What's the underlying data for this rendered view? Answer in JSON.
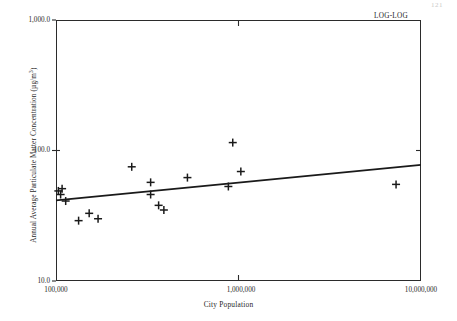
{
  "page": {
    "number": "121"
  },
  "annotation": {
    "loglog_label": "LOG-LOG"
  },
  "axes": {
    "x_title": "City Population",
    "y_title_main": "Annual Average Particulate Matter Concentration (µg/m",
    "y_title_exponent": "3",
    "y_title_close": ")",
    "x_ticks": [
      {
        "label": "100,000",
        "value": 100000
      },
      {
        "label": "1,000,000",
        "value": 1000000
      },
      {
        "label": "10,000,000",
        "value": 10000000
      }
    ],
    "y_ticks": [
      {
        "label": "10.0",
        "value": 10
      },
      {
        "label": "100.0",
        "value": 100
      },
      {
        "label": "1,000.0",
        "value": 1000
      }
    ]
  },
  "chart_data": {
    "type": "scatter",
    "title": "",
    "subtitle": "",
    "annotation": "LOG-LOG",
    "xlabel": "City Population",
    "ylabel": "Annual Average Particulate Matter Concentration (µg/m³)",
    "xscale": "log",
    "yscale": "log",
    "xlim": [
      100000,
      10000000
    ],
    "ylim": [
      10,
      1000
    ],
    "grid": false,
    "legend": null,
    "marker": "plus",
    "marker_color": "#1a1a1a",
    "xticks": [
      100000,
      1000000,
      10000000
    ],
    "xticklabels": [
      "100,000",
      "1,000,000",
      "10,000,000"
    ],
    "yticks": [
      10,
      100,
      1000
    ],
    "yticklabels": [
      "10.0",
      "100.0",
      "1,000.0"
    ],
    "points": [
      {
        "x": 103000,
        "y": 49
      },
      {
        "x": 108000,
        "y": 51
      },
      {
        "x": 106000,
        "y": 46
      },
      {
        "x": 113000,
        "y": 41
      },
      {
        "x": 133000,
        "y": 29
      },
      {
        "x": 152000,
        "y": 33
      },
      {
        "x": 170000,
        "y": 30
      },
      {
        "x": 260000,
        "y": 75
      },
      {
        "x": 330000,
        "y": 57
      },
      {
        "x": 330000,
        "y": 46
      },
      {
        "x": 365000,
        "y": 38
      },
      {
        "x": 390000,
        "y": 35
      },
      {
        "x": 525000,
        "y": 62
      },
      {
        "x": 880000,
        "y": 53
      },
      {
        "x": 930000,
        "y": 115
      },
      {
        "x": 1030000,
        "y": 69
      },
      {
        "x": 7300000,
        "y": 55
      }
    ],
    "trend_line": {
      "type": "linear-in-log-log",
      "x_start": 100000,
      "y_start": 41.5,
      "x_end": 10000000,
      "y_end": 77.5
    }
  }
}
